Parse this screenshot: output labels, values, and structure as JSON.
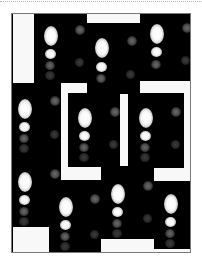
{
  "figure": {
    "colors": {
      "background": "#ffffff",
      "tile": "#000000",
      "mask": "#f8f8f8",
      "frame": "#7a7a7a",
      "dotted_rule": "#b8b8b8"
    },
    "tiles": [
      {
        "id": "top-left",
        "spots": [
          "large",
          "medium",
          "dim",
          "dim",
          "side-dim"
        ]
      },
      {
        "id": "top-center",
        "spots": [
          "large",
          "medium",
          "dim",
          "side-dim"
        ]
      },
      {
        "id": "top-right",
        "spots": [
          "large",
          "medium",
          "dim",
          "side-dim"
        ]
      },
      {
        "id": "middle-left",
        "spots": [
          "large",
          "medium",
          "dim",
          "side-dim"
        ]
      },
      {
        "id": "middle-center",
        "spots": [
          "large",
          "medium",
          "dim",
          "side-dim"
        ]
      },
      {
        "id": "middle-right",
        "spots": [
          "large",
          "medium",
          "dim",
          "side-dim"
        ]
      },
      {
        "id": "bottom-1",
        "spots": [
          "large",
          "medium",
          "dim",
          "side-dim"
        ]
      },
      {
        "id": "bottom-2",
        "spots": [
          "large",
          "medium",
          "dim",
          "side-dim"
        ]
      },
      {
        "id": "bottom-3",
        "spots": [
          "large",
          "medium",
          "dim",
          "side-dim"
        ]
      },
      {
        "id": "bottom-4",
        "spots": [
          "large",
          "medium",
          "dim",
          "side-dim"
        ]
      }
    ]
  }
}
